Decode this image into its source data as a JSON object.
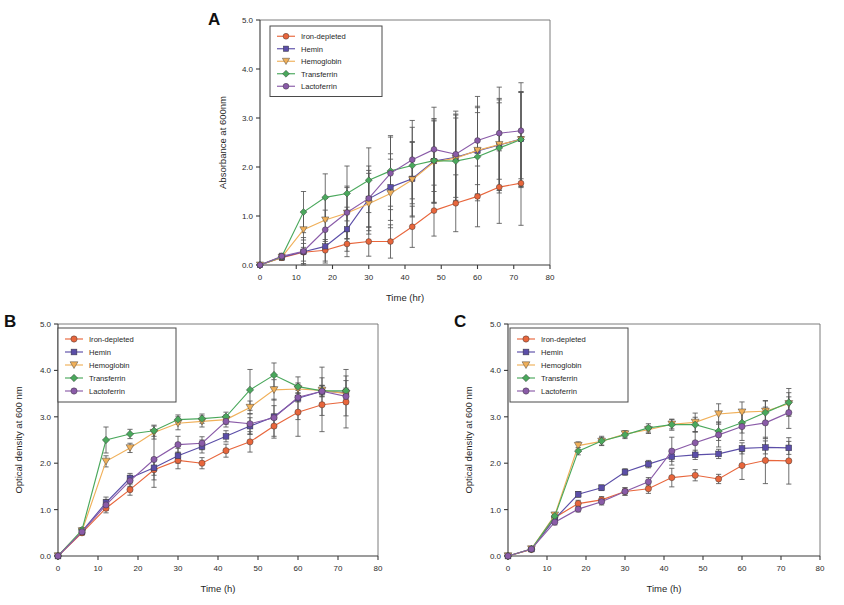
{
  "figure": {
    "background": "#ffffff",
    "panels": [
      "A",
      "B",
      "C"
    ]
  },
  "series_style": {
    "iron_depleted": {
      "label": "Iron-depleted",
      "color": "#e8663c",
      "marker": "circle"
    },
    "hemin": {
      "label": "Hemin",
      "color": "#5b4ea8",
      "marker": "square"
    },
    "hemoglobin": {
      "label": "Hemoglobin",
      "color": "#f0b05a",
      "marker": "triangle-down"
    },
    "transferrin": {
      "label": "Transferrin",
      "color": "#4aa85c",
      "marker": "diamond"
    },
    "lactoferrin": {
      "label": "Lactoferrin",
      "color": "#8a5ba8",
      "marker": "circle"
    }
  },
  "panelA": {
    "letter": "A",
    "chart_data": {
      "type": "line",
      "title": "",
      "xlabel": "Time (hr)",
      "ylabel": "Absorbance at 600nm",
      "xlim": [
        0,
        80
      ],
      "ylim": [
        0,
        5.0
      ],
      "xticks": [
        0,
        10,
        20,
        30,
        40,
        50,
        60,
        70,
        80
      ],
      "xticklabels": [
        "0",
        "10",
        "20",
        "30",
        "40",
        "50",
        "60",
        "70",
        "80"
      ],
      "yticks": [
        0,
        1.0,
        2.0,
        3.0,
        4.0,
        5.0
      ],
      "yticklabels": [
        "0.0",
        "1.0",
        "2.0",
        "3.0",
        "4.0",
        "5.0"
      ],
      "grid": false,
      "legend_position": "top-left",
      "x": [
        0,
        6,
        12,
        18,
        24,
        30,
        36,
        42,
        48,
        54,
        60,
        66,
        72
      ],
      "series": [
        {
          "name": "Iron-depleted",
          "key": "iron_depleted",
          "values": [
            0.0,
            0.15,
            0.26,
            0.3,
            0.43,
            0.48,
            0.48,
            0.78,
            1.11,
            1.26,
            1.4,
            1.59,
            1.67
          ],
          "err": [
            0.0,
            0.05,
            0.18,
            0.22,
            0.26,
            0.3,
            0.34,
            0.42,
            0.52,
            0.58,
            0.62,
            0.74,
            0.86
          ]
        },
        {
          "name": "Hemin",
          "key": "hemin",
          "values": [
            0.0,
            0.16,
            0.27,
            0.38,
            0.73,
            1.35,
            1.59,
            1.76,
            2.12,
            2.2,
            2.33,
            2.45,
            2.57
          ],
          "err": [
            0.0,
            0.06,
            0.24,
            0.34,
            0.45,
            0.58,
            0.68,
            0.76,
            0.84,
            0.88,
            0.88,
            0.92,
            0.96
          ]
        },
        {
          "name": "Hemoglobin",
          "key": "hemoglobin",
          "values": [
            0.0,
            0.16,
            0.72,
            0.92,
            1.06,
            1.25,
            1.46,
            1.74,
            2.1,
            2.18,
            2.34,
            2.46,
            2.56
          ],
          "err": [
            0.0,
            0.06,
            0.36,
            0.44,
            0.52,
            0.62,
            0.7,
            0.76,
            0.84,
            0.88,
            0.9,
            0.94,
            0.98
          ]
        },
        {
          "name": "Transferrin",
          "key": "transferrin",
          "values": [
            0.0,
            0.17,
            1.08,
            1.38,
            1.46,
            1.73,
            1.92,
            2.03,
            2.13,
            2.12,
            2.21,
            2.39,
            2.56
          ],
          "err": [
            0.0,
            0.06,
            0.42,
            0.48,
            0.56,
            0.66,
            0.72,
            0.78,
            0.86,
            0.88,
            0.9,
            0.92,
            0.96
          ]
        },
        {
          "name": "Lactoferrin",
          "key": "lactoferrin",
          "values": [
            0.0,
            0.18,
            0.28,
            0.72,
            1.07,
            1.36,
            1.87,
            2.15,
            2.36,
            2.26,
            2.54,
            2.69,
            2.74
          ],
          "err": [
            0.0,
            0.06,
            0.28,
            0.4,
            0.54,
            0.66,
            0.74,
            0.8,
            0.86,
            0.88,
            0.9,
            0.94,
            0.98
          ]
        }
      ]
    }
  },
  "panelB": {
    "letter": "B",
    "chart_data": {
      "type": "line",
      "title": "",
      "xlabel": "Time (h)",
      "ylabel": "Optical density at 600 nm",
      "xlim": [
        0,
        80
      ],
      "ylim": [
        0,
        5.0
      ],
      "xticks": [
        0,
        10,
        20,
        30,
        40,
        50,
        60,
        70,
        80
      ],
      "xticklabels": [
        "0",
        "10",
        "20",
        "30",
        "40",
        "50",
        "60",
        "70",
        "80"
      ],
      "yticks": [
        0,
        1.0,
        2.0,
        3.0,
        4.0,
        5.0
      ],
      "yticklabels": [
        "0.0",
        "1.0",
        "2.0",
        "3.0",
        "4.0",
        "5.0"
      ],
      "grid": false,
      "legend_position": "top-left",
      "x": [
        0,
        6,
        12,
        18,
        24,
        30,
        36,
        42,
        48,
        54,
        60,
        66,
        72
      ],
      "series": [
        {
          "name": "Iron-depleted",
          "key": "iron_depleted",
          "values": [
            0.0,
            0.5,
            1.03,
            1.43,
            1.86,
            2.06,
            2.0,
            2.27,
            2.46,
            2.8,
            3.1,
            3.26,
            3.32
          ],
          "err": [
            0.0,
            0.05,
            0.1,
            0.12,
            0.22,
            0.18,
            0.12,
            0.14,
            0.22,
            0.26,
            0.52,
            0.58,
            0.56
          ]
        },
        {
          "name": "Hemin",
          "key": "hemin",
          "values": [
            0.0,
            0.53,
            1.15,
            1.68,
            1.9,
            2.16,
            2.36,
            2.58,
            2.8,
            3.0,
            3.4,
            3.55,
            3.52
          ],
          "err": [
            0.0,
            0.05,
            0.12,
            0.1,
            0.16,
            0.16,
            0.14,
            0.12,
            0.18,
            0.24,
            0.46,
            0.52,
            0.5
          ]
        },
        {
          "name": "Hemoglobin",
          "key": "hemoglobin",
          "values": [
            0.0,
            0.54,
            2.04,
            2.33,
            2.66,
            2.86,
            2.9,
            2.94,
            3.2,
            3.58,
            3.6,
            3.57,
            3.5
          ],
          "err": [
            0.0,
            0.05,
            0.12,
            0.1,
            0.14,
            0.14,
            0.12,
            0.1,
            0.14,
            0.22,
            0.1,
            0.1,
            0.12
          ]
        },
        {
          "name": "Transferrin",
          "key": "transferrin",
          "values": [
            0.0,
            0.56,
            2.5,
            2.63,
            2.7,
            2.94,
            2.96,
            3.0,
            3.58,
            3.9,
            3.65,
            3.56,
            3.56
          ],
          "err": [
            0.0,
            0.05,
            0.28,
            0.1,
            0.12,
            0.1,
            0.1,
            0.1,
            0.44,
            0.26,
            0.08,
            0.12,
            0.22
          ]
        },
        {
          "name": "Lactoferrin",
          "key": "lactoferrin",
          "values": [
            0.0,
            0.52,
            1.1,
            1.62,
            2.08,
            2.4,
            2.43,
            2.9,
            2.85,
            2.98,
            3.42,
            3.55,
            3.44
          ],
          "err": [
            0.0,
            0.05,
            0.12,
            0.12,
            0.6,
            0.18,
            0.14,
            0.12,
            0.22,
            0.4,
            0.1,
            0.12,
            0.16
          ]
        }
      ]
    }
  },
  "panelC": {
    "letter": "C",
    "chart_data": {
      "type": "line",
      "title": "",
      "xlabel": "Time (h)",
      "ylabel": "Optical density at 600 nm",
      "xlim": [
        0,
        80
      ],
      "ylim": [
        0,
        5.0
      ],
      "xticks": [
        0,
        10,
        20,
        30,
        40,
        50,
        60,
        70,
        80
      ],
      "xticklabels": [
        "0",
        "10",
        "20",
        "30",
        "40",
        "50",
        "60",
        "70",
        "80"
      ],
      "yticks": [
        0,
        1.0,
        2.0,
        3.0,
        4.0,
        5.0
      ],
      "yticklabels": [
        "0.0",
        "1.0",
        "2.0",
        "3.0",
        "4.0",
        "5.0"
      ],
      "grid": false,
      "legend_position": "top-left",
      "x": [
        0,
        6,
        12,
        18,
        24,
        30,
        36,
        42,
        48,
        54,
        60,
        66,
        72
      ],
      "series": [
        {
          "name": "Iron-depleted",
          "key": "iron_depleted",
          "values": [
            0.0,
            0.14,
            0.83,
            1.13,
            1.21,
            1.39,
            1.45,
            1.69,
            1.74,
            1.66,
            1.95,
            2.06,
            2.05
          ],
          "err": [
            0.0,
            0.03,
            0.06,
            0.07,
            0.07,
            0.08,
            0.1,
            0.2,
            0.12,
            0.1,
            0.3,
            0.5,
            0.5
          ]
        },
        {
          "name": "Hemin",
          "key": "hemin",
          "values": [
            0.0,
            0.15,
            0.8,
            1.33,
            1.47,
            1.81,
            1.98,
            2.14,
            2.18,
            2.2,
            2.32,
            2.34,
            2.33
          ],
          "err": [
            0.0,
            0.03,
            0.07,
            0.06,
            0.06,
            0.07,
            0.08,
            0.1,
            0.1,
            0.1,
            0.12,
            0.14,
            0.14
          ]
        },
        {
          "name": "Hemoglobin",
          "key": "hemoglobin",
          "values": [
            0.0,
            0.15,
            0.88,
            2.38,
            2.47,
            2.63,
            2.72,
            2.84,
            2.88,
            3.06,
            3.1,
            3.12,
            3.28
          ],
          "err": [
            0.0,
            0.03,
            0.06,
            0.08,
            0.08,
            0.07,
            0.08,
            0.1,
            0.2,
            0.22,
            0.22,
            0.22,
            0.24
          ]
        },
        {
          "name": "Transferrin",
          "key": "transferrin",
          "values": [
            0.0,
            0.15,
            0.86,
            2.26,
            2.48,
            2.61,
            2.76,
            2.83,
            2.83,
            2.69,
            2.87,
            3.09,
            3.31
          ],
          "err": [
            0.0,
            0.03,
            0.06,
            0.08,
            0.1,
            0.08,
            0.09,
            0.12,
            0.16,
            0.2,
            0.22,
            0.26,
            0.3
          ]
        },
        {
          "name": "Lactoferrin",
          "key": "lactoferrin",
          "values": [
            0.0,
            0.15,
            0.73,
            1.01,
            1.17,
            1.39,
            1.6,
            2.26,
            2.44,
            2.61,
            2.79,
            2.87,
            3.09
          ],
          "err": [
            0.0,
            0.03,
            0.06,
            0.06,
            0.07,
            0.08,
            0.09,
            0.3,
            0.24,
            0.26,
            0.3,
            0.34,
            0.34
          ]
        }
      ]
    }
  }
}
